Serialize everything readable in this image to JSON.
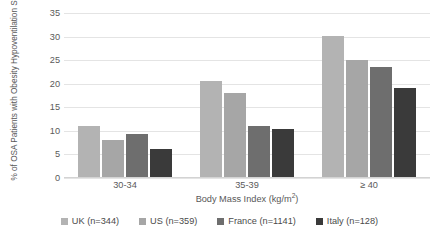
{
  "chart_data": {
    "type": "bar",
    "title": "",
    "subtitle": "",
    "xlabel": "Body Mass Index (kg/m2)",
    "xlabel_base": "Body Mass Index (kg/m",
    "xlabel_sup": "2",
    "xlabel_tail": ")",
    "ylabel": "% of OSA Patients with Obesity Hypoventilation Syndrome",
    "categories": [
      "30-34",
      "35-39",
      "≥ 40"
    ],
    "series": [
      {
        "name": "UK (n=344)",
        "values": [
          11.0,
          20.5,
          30.2
        ],
        "color": "#b3b3b3"
      },
      {
        "name": "US (n=359)",
        "values": [
          8.0,
          18.0,
          25.0
        ],
        "color": "#a6a6a6"
      },
      {
        "name": "France (n=1141)",
        "values": [
          9.3,
          11.0,
          23.5
        ],
        "color": "#6e6e6e"
      },
      {
        "name": "Italy (n=128)",
        "values": [
          6.2,
          10.3,
          19.0
        ],
        "color": "#3a3a3a"
      }
    ],
    "ylim": [
      0,
      35
    ],
    "yticks": [
      0,
      5,
      10,
      15,
      20,
      25,
      30,
      35
    ],
    "ytick_labels": [
      "0",
      "5",
      "10",
      "15",
      "20",
      "25",
      "30",
      "35"
    ],
    "grid": true,
    "grid_axis": "y",
    "legend_position": "bottom",
    "legend_orientation": "horizontal",
    "background": "#ffffff",
    "grid_color": "#e4e4e4",
    "text_color": "#4a4a4a"
  }
}
